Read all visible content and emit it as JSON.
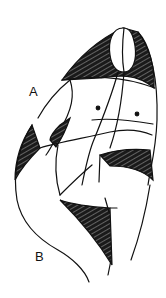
{
  "figure": {
    "type": "abstract figure line drawing",
    "labels": [
      "A",
      "B"
    ],
    "colors": {
      "background": "#ffffff",
      "ink": "#111111",
      "hatch_fill": "#1a1a1a"
    }
  },
  "labels": {
    "a": "A",
    "b": "B"
  }
}
